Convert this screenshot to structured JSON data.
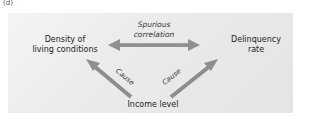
{
  "panel_label": "(d)",
  "nodes": {
    "density": "Density of living conditions",
    "density_line1": "Density of",
    "density_line2": "living conditions",
    "delinquency_line1": "Delinquency",
    "delinquency_line2": "rate",
    "income": "Income level"
  },
  "edges": {
    "spurious_line1": "Spurious",
    "spurious_line2": "correlation",
    "cause_left": "Cause",
    "cause_right": "Cause"
  },
  "colors": {
    "arrow": "#8a8a8a",
    "panel": "#e8e8e8",
    "text": "#222222"
  }
}
